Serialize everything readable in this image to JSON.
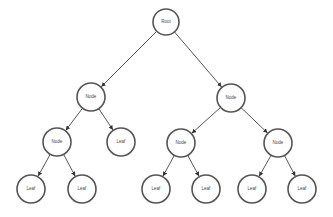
{
  "diagram": {
    "type": "tree",
    "nodes": [
      {
        "id": "root",
        "label": "Root",
        "x": 166,
        "y": 22,
        "r": 13
      },
      {
        "id": "n1",
        "label": "Node",
        "x": 91,
        "y": 97,
        "r": 14
      },
      {
        "id": "n2",
        "label": "Node",
        "x": 231,
        "y": 98,
        "r": 14
      },
      {
        "id": "n3",
        "label": "Node",
        "x": 57,
        "y": 142,
        "r": 14
      },
      {
        "id": "l1",
        "label": "Leaf",
        "x": 121,
        "y": 142,
        "r": 14
      },
      {
        "id": "n4",
        "label": "Node",
        "x": 181,
        "y": 143,
        "r": 14
      },
      {
        "id": "n5",
        "label": "Node",
        "x": 278,
        "y": 143,
        "r": 14
      },
      {
        "id": "l2",
        "label": "Leaf",
        "x": 31,
        "y": 189,
        "r": 14
      },
      {
        "id": "l3",
        "label": "Leaf",
        "x": 82,
        "y": 189,
        "r": 14
      },
      {
        "id": "l4",
        "label": "Leaf",
        "x": 156,
        "y": 189,
        "r": 14
      },
      {
        "id": "l5",
        "label": "Leaf",
        "x": 206,
        "y": 189,
        "r": 14
      },
      {
        "id": "l6",
        "label": "Leaf",
        "x": 252,
        "y": 189,
        "r": 14
      },
      {
        "id": "l7",
        "label": "Leaf",
        "x": 302,
        "y": 189,
        "r": 14
      }
    ],
    "edges": [
      [
        "root",
        "n1"
      ],
      [
        "root",
        "n2"
      ],
      [
        "n1",
        "n3"
      ],
      [
        "n1",
        "l1"
      ],
      [
        "n2",
        "n4"
      ],
      [
        "n2",
        "n5"
      ],
      [
        "n3",
        "l2"
      ],
      [
        "n3",
        "l3"
      ],
      [
        "n4",
        "l4"
      ],
      [
        "n4",
        "l5"
      ],
      [
        "n5",
        "l6"
      ],
      [
        "n5",
        "l7"
      ]
    ],
    "colors": {
      "stroke": "#555555",
      "edge": "#444444",
      "text": "#444444",
      "background": "#ffffff"
    }
  }
}
